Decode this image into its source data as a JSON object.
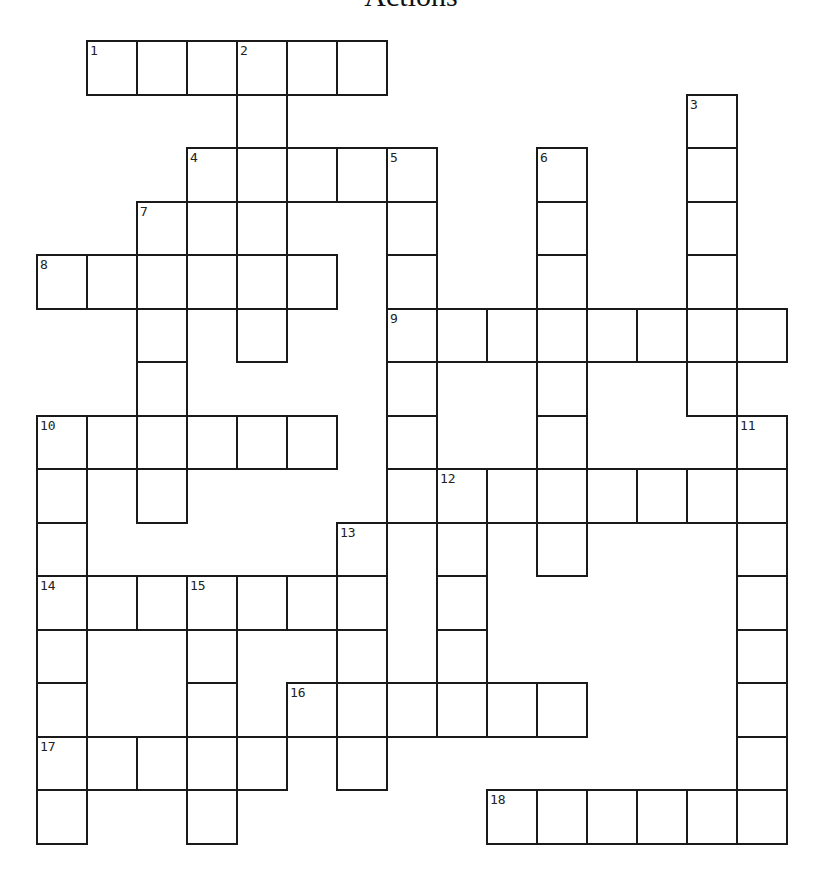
{
  "title": "Actions",
  "grid": {
    "origin_x": 36,
    "origin_y": 40,
    "cell_w": 50,
    "cell_h": 53.5,
    "cols": 15,
    "rows": 15
  },
  "entries": [
    {
      "number": 1,
      "direction": "across",
      "row": 0,
      "col": 1,
      "length": 6
    },
    {
      "number": 2,
      "direction": "down",
      "row": 0,
      "col": 4,
      "length": 6
    },
    {
      "number": 3,
      "direction": "down",
      "row": 1,
      "col": 13,
      "length": 6
    },
    {
      "number": 4,
      "direction": "across",
      "row": 2,
      "col": 3,
      "length": 5
    },
    {
      "number": 5,
      "direction": "down",
      "row": 2,
      "col": 7,
      "length": 7
    },
    {
      "number": 6,
      "direction": "down",
      "row": 2,
      "col": 10,
      "length": 8
    },
    {
      "number": 7,
      "direction": "down",
      "row": 3,
      "col": 2,
      "length": 6
    },
    {
      "number": 8,
      "direction": "across",
      "row": 4,
      "col": 0,
      "length": 6
    },
    {
      "number": 9,
      "direction": "across",
      "row": 5,
      "col": 7,
      "length": 8
    },
    {
      "number": 10,
      "direction": "across",
      "row": 7,
      "col": 0,
      "length": 6
    },
    {
      "number": 10,
      "direction": "down",
      "row": 7,
      "col": 0,
      "length": 8
    },
    {
      "number": 11,
      "direction": "down",
      "row": 7,
      "col": 14,
      "length": 8
    },
    {
      "number": 12,
      "direction": "across",
      "row": 8,
      "col": 8,
      "length": 7
    },
    {
      "number": 12,
      "direction": "down",
      "row": 8,
      "col": 8,
      "length": 5
    },
    {
      "number": 13,
      "direction": "down",
      "row": 9,
      "col": 6,
      "length": 5
    },
    {
      "number": 14,
      "direction": "across",
      "row": 10,
      "col": 0,
      "length": 7
    },
    {
      "number": 15,
      "direction": "down",
      "row": 10,
      "col": 3,
      "length": 5
    },
    {
      "number": 16,
      "direction": "across",
      "row": 12,
      "col": 5,
      "length": 6
    },
    {
      "number": 17,
      "direction": "across",
      "row": 13,
      "col": 0,
      "length": 5
    },
    {
      "number": 18,
      "direction": "across",
      "row": 14,
      "col": 9,
      "length": 6
    }
  ],
  "colors": {
    "line": "#1a1a1a",
    "cell": "#ffffff",
    "number": "#222222"
  }
}
